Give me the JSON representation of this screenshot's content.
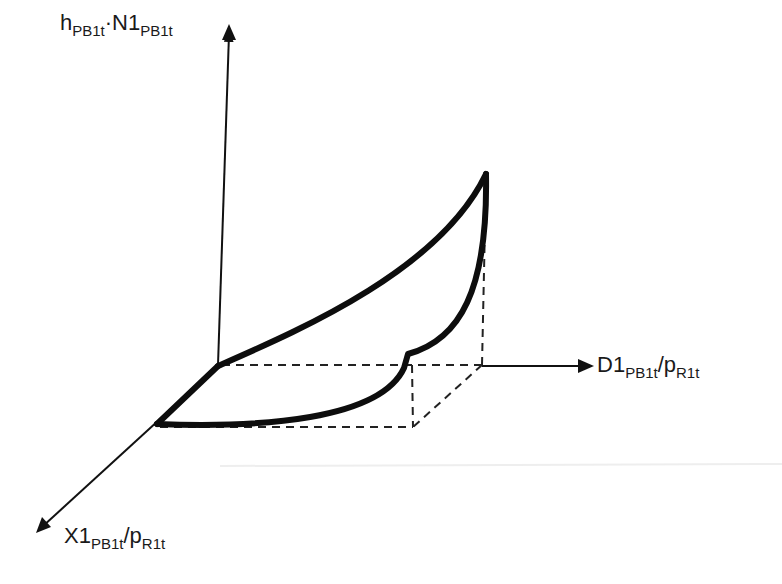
{
  "diagram": {
    "type": "3d-axes-curve-sketch",
    "axes": {
      "vertical": {
        "main": "h",
        "sub1": "PB1t",
        "dot": "·",
        "main2": "N1",
        "sub2": "PB1t"
      },
      "horizontal": {
        "main": "D1",
        "sub1": "PB1t",
        "slash": "/",
        "main2": "p",
        "sub2": "R1t"
      },
      "depth": {
        "main": "X1",
        "sub1": "PB1t",
        "slash": "/",
        "main2": "p",
        "sub2": "R1t"
      }
    },
    "colors": {
      "stroke": "#111111",
      "background": "#ffffff"
    }
  }
}
